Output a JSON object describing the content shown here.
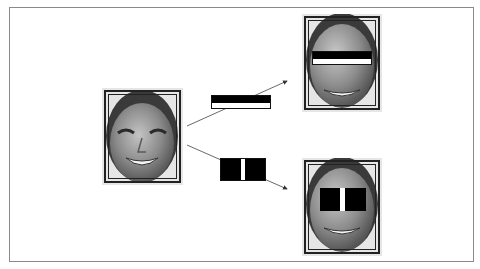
{
  "diagram": {
    "title": "",
    "source_image": {
      "label": "Input face",
      "description": "grayscale face with detection window"
    },
    "features": [
      {
        "name": "edge-feature",
        "type": "two-rectangle horizontal edge",
        "regions": [
          "black",
          "white"
        ]
      },
      {
        "name": "line-feature",
        "type": "three-rectangle vertical line",
        "regions": [
          "black",
          "white",
          "black"
        ]
      }
    ],
    "outputs": [
      {
        "label": "Edge feature applied over eyes",
        "feature": "edge-feature"
      },
      {
        "label": "Line feature applied over eyes and nose bridge",
        "feature": "line-feature"
      }
    ],
    "colors": {
      "border": "#8a8a8a",
      "feature_dark": "#000000",
      "feature_light": "#ffffff",
      "frame_line": "#222222"
    }
  }
}
